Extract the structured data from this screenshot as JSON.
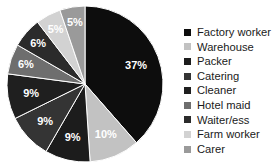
{
  "chart_data": {
    "type": "pie",
    "title": "",
    "subtitle": "",
    "xlabel": "",
    "ylabel": "",
    "legend_position": "right",
    "grid": false,
    "start_angle_deg": 0,
    "direction": "clockwise",
    "units": "percent",
    "categories": [
      "Factory worker",
      "Warehouse",
      "Packer",
      "Catering",
      "Cleaner",
      "Hotel maid",
      "Waiter/ess",
      "Farm worker",
      "Carer"
    ],
    "values": [
      37,
      10,
      9,
      9,
      9,
      6,
      6,
      5,
      5
    ],
    "data_labels": [
      "37%",
      "10%",
      "9%",
      "9%",
      "9%",
      "6%",
      "6%",
      "5%",
      "5%"
    ],
    "colors": [
      "#0d0d0d",
      "#c2c2c2",
      "#1c1c1c",
      "#343434",
      "#1f1f1f",
      "#6e6e6e",
      "#2b2b2b",
      "#d2d2d2",
      "#9a9a9a"
    ],
    "slices": [
      {
        "label": "Factory worker",
        "value": 37,
        "data_label": "37%",
        "color": "#0d0d0d"
      },
      {
        "label": "Warehouse",
        "value": 10,
        "data_label": "10%",
        "color": "#c2c2c2"
      },
      {
        "label": "Packer",
        "value": 9,
        "data_label": "9%",
        "color": "#1c1c1c"
      },
      {
        "label": "Catering",
        "value": 9,
        "data_label": "9%",
        "color": "#343434"
      },
      {
        "label": "Cleaner",
        "value": 9,
        "data_label": "9%",
        "color": "#1f1f1f"
      },
      {
        "label": "Hotel maid",
        "value": 6,
        "data_label": "6%",
        "color": "#6e6e6e"
      },
      {
        "label": "Waiter/ess",
        "value": 6,
        "data_label": "6%",
        "color": "#2b2b2b"
      },
      {
        "label": "Farm worker",
        "value": 5,
        "data_label": "5%",
        "color": "#d2d2d2"
      },
      {
        "label": "Carer",
        "value": 5,
        "data_label": "5%",
        "color": "#9a9a9a"
      }
    ]
  },
  "legend": {
    "items": [
      {
        "label": "Factory worker",
        "color": "#0d0d0d"
      },
      {
        "label": "Warehouse",
        "color": "#c2c2c2"
      },
      {
        "label": "Packer",
        "color": "#1c1c1c"
      },
      {
        "label": "Catering",
        "color": "#343434"
      },
      {
        "label": "Cleaner",
        "color": "#1f1f1f"
      },
      {
        "label": "Hotel maid",
        "color": "#6e6e6e"
      },
      {
        "label": "Waiter/ess",
        "color": "#2b2b2b"
      },
      {
        "label": "Farm worker",
        "color": "#d2d2d2"
      },
      {
        "label": "Carer",
        "color": "#9a9a9a"
      }
    ]
  },
  "geometry": {
    "center_x": 85,
    "center_y": 84,
    "radius": 78,
    "label_radius_factor": 0.7
  }
}
